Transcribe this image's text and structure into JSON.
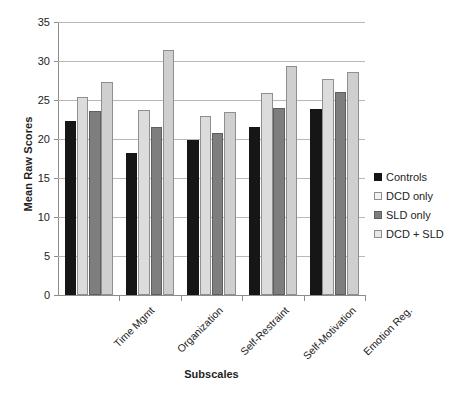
{
  "chart_data": {
    "type": "bar",
    "title": "",
    "xlabel": "Subscales",
    "ylabel": "Mean Raw Scores",
    "ylim": [
      0,
      35
    ],
    "ytick_step": 5,
    "yticks": [
      0,
      5,
      10,
      15,
      20,
      25,
      30,
      35
    ],
    "grid": true,
    "legend_position": "right",
    "categories": [
      "Time Mgmt",
      "Organization",
      "Self-Restraint",
      "Self-Motivation",
      "Emotion Reg."
    ],
    "series": [
      {
        "name": "Controls",
        "color": "#161616",
        "values": [
          22.3,
          18.2,
          19.9,
          21.5,
          23.9
        ]
      },
      {
        "name": "DCD only",
        "color": "#dcdcdc",
        "values": [
          25.4,
          23.7,
          23.0,
          25.9,
          27.7
        ]
      },
      {
        "name": "SLD only",
        "color": "#7e7e7e",
        "values": [
          23.6,
          21.6,
          20.8,
          24.0,
          26.0
        ]
      },
      {
        "name": "DCD + SLD",
        "color": "#cfcfcf",
        "values": [
          27.3,
          31.4,
          23.4,
          29.3,
          28.6
        ]
      }
    ]
  },
  "axis": {
    "y_title": "Mean Raw Scores",
    "x_title": "Subscales"
  },
  "colors": {
    "controls": "#161616",
    "dcd_only": "#dcdcdc",
    "sld_only": "#7e7e7e",
    "dcd_sld": "#cfcfcf",
    "gridline": "#b8b8b8",
    "axis": "#8c8c8c",
    "background": "#ffffff"
  }
}
